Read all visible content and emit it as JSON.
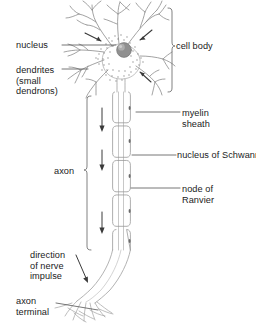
{
  "diagram": {
    "type": "labelled-biological-diagram",
    "background_color": "#ffffff",
    "line_color": "#8c8c8c",
    "text_color": "#1b1b1b",
    "nucleus_color": "#8e8e8e"
  },
  "labels": {
    "nucleus": "nucleus",
    "dendrites": "dendrites\n(small\ndendrons)",
    "cell_body": "cell body",
    "myelin_sheath": "myelin\nsheath",
    "schwann_nucleus": "nucleus of Schwann cell",
    "node_of_ranvier": "node of\nRanvier",
    "axon": "axon",
    "direction_of_impulse": "direction\nof nerve\nimpulse",
    "axon_terminal": "axon\nterminal",
    "caption": ""
  },
  "brackets": [
    {
      "name": "cell-body-bracket",
      "label": "cell body",
      "side": "right",
      "spans": "dendrites and soma"
    },
    {
      "name": "axon-bracket",
      "label": "axon",
      "side": "left",
      "spans": "myelinated axon length"
    }
  ],
  "arrows": {
    "impulse_arrows_in_axon": 3,
    "dendrite_input_arrows": 3,
    "direction_arrow": 1,
    "direction": "downward / away from cell body"
  },
  "structures": [
    "dendrites",
    "cell body",
    "nucleus",
    "axon",
    "myelin sheath",
    "node of Ranvier",
    "nucleus of Schwann cell",
    "axon terminal"
  ]
}
